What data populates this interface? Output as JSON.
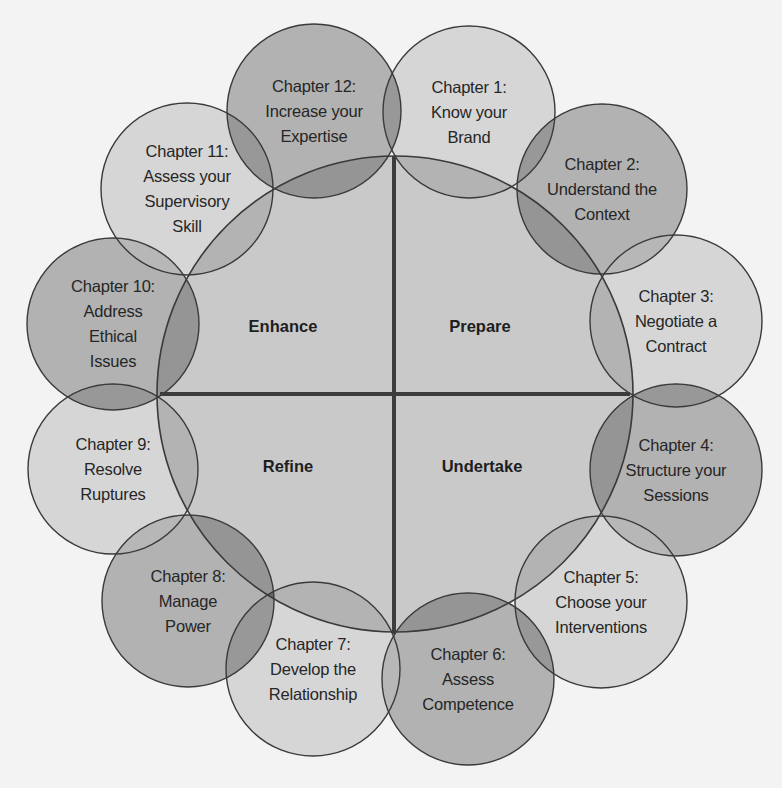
{
  "diagram": {
    "colors": {
      "background": "#f3f3f3",
      "center_fill": "#c9c9c9",
      "light_fill": "#d6d6d6",
      "dark_fill": "#b2b2b2",
      "stroke": "#3a3a3a",
      "axis": "#3c3c3c"
    },
    "center_circle": {
      "cx": 395,
      "cy": 394,
      "r": 238
    },
    "axes": {
      "vertical": {
        "x": 394,
        "y1": 156,
        "y2": 634
      },
      "horizontal": {
        "y": 394,
        "x1": 160,
        "x2": 630
      }
    },
    "quadrants": [
      {
        "id": "enhance",
        "label": "Enhance",
        "x": 283,
        "y": 326
      },
      {
        "id": "prepare",
        "label": "Prepare",
        "x": 480,
        "y": 326
      },
      {
        "id": "refine",
        "label": "Refine",
        "x": 288,
        "y": 466
      },
      {
        "id": "undertake",
        "label": "Undertake",
        "x": 482,
        "y": 466
      }
    ],
    "chapters": [
      {
        "id": "ch1",
        "title": "Chapter 1:",
        "lines": [
          "Know your",
          "Brand"
        ],
        "cx": 469,
        "cy": 112,
        "r": 86,
        "tone": "light"
      },
      {
        "id": "ch2",
        "title": "Chapter 2:",
        "lines": [
          "Understand the",
          "Context"
        ],
        "cx": 602,
        "cy": 189,
        "r": 85,
        "tone": "dark"
      },
      {
        "id": "ch3",
        "title": "Chapter 3:",
        "lines": [
          "Negotiate a",
          "Contract"
        ],
        "cx": 676,
        "cy": 321,
        "r": 86,
        "tone": "light"
      },
      {
        "id": "ch4",
        "title": "Chapter 4:",
        "lines": [
          "Structure your",
          "Sessions"
        ],
        "cx": 676,
        "cy": 470,
        "r": 86,
        "tone": "dark"
      },
      {
        "id": "ch5",
        "title": "Chapter 5:",
        "lines": [
          "Choose your",
          "Interventions"
        ],
        "cx": 601,
        "cy": 602,
        "r": 86,
        "tone": "light"
      },
      {
        "id": "ch6",
        "title": "Chapter 6:",
        "lines": [
          "Assess",
          "Competence"
        ],
        "cx": 468,
        "cy": 679,
        "r": 86,
        "tone": "dark"
      },
      {
        "id": "ch7",
        "title": "Chapter 7:",
        "lines": [
          "Develop the",
          "Relationship"
        ],
        "cx": 313,
        "cy": 669,
        "r": 87,
        "tone": "light"
      },
      {
        "id": "ch8",
        "title": "Chapter 8:",
        "lines": [
          "Manage",
          "Power"
        ],
        "cx": 188,
        "cy": 601,
        "r": 86,
        "tone": "dark"
      },
      {
        "id": "ch9",
        "title": "Chapter 9:",
        "lines": [
          "Resolve",
          "Ruptures"
        ],
        "cx": 113,
        "cy": 469,
        "r": 85,
        "tone": "light"
      },
      {
        "id": "ch10",
        "title": "Chapter 10:",
        "lines": [
          "Address",
          "Ethical",
          "Issues"
        ],
        "cx": 113,
        "cy": 324,
        "r": 86,
        "tone": "dark"
      },
      {
        "id": "ch11",
        "title": "Chapter 11:",
        "lines": [
          "Assess your",
          "Supervisory",
          "Skill"
        ],
        "cx": 187,
        "cy": 189,
        "r": 86,
        "tone": "light"
      },
      {
        "id": "ch12",
        "title": "Chapter 12:",
        "lines": [
          "Increase your",
          "Expertise"
        ],
        "cx": 314,
        "cy": 111,
        "r": 87,
        "tone": "dark"
      }
    ]
  }
}
